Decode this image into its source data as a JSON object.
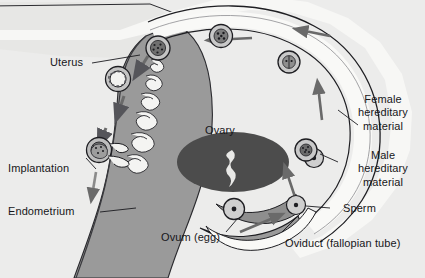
{
  "figure": {
    "background_color": "#ececeb",
    "outline_color": "#1b1b1f",
    "tissue_color": "#9a9a9a",
    "ovary_color": "#4c4c4c",
    "lumen_color": "#f7f7f5",
    "cavity_color": "#e6e6e4",
    "text_color": "#17171a"
  },
  "labels": {
    "uterus": "Uterus",
    "implantation": "Implantation",
    "endometrium": "Endometrium",
    "ovary": "Ovary",
    "ovum": "Ovum (egg)",
    "oviduct": "Oviduct (fallopian tube)",
    "sperm": "Sperm",
    "female_hereditary": {
      "line1": "Female",
      "line2": "hereditary",
      "line3": "material"
    },
    "male_hereditary": {
      "line1": "Male",
      "line2": "hereditary",
      "line3": "material"
    }
  },
  "structures": [
    {
      "name": "uterine-cavity",
      "label": "Uterus"
    },
    {
      "name": "endometrium",
      "label": "Endometrium"
    },
    {
      "name": "ovary",
      "label": "Ovary"
    },
    {
      "name": "oviduct",
      "label": "Oviduct (fallopian tube)"
    },
    {
      "name": "fimbriae",
      "label": ""
    }
  ],
  "cells": [
    {
      "name": "sperm-lower-right",
      "type": "sperm",
      "cx": 296,
      "cy": 205
    },
    {
      "name": "sperm-mid-right",
      "type": "sperm",
      "cx": 312,
      "cy": 160
    },
    {
      "name": "ovum-egg",
      "type": "ovum",
      "cx": 234,
      "cy": 209
    },
    {
      "name": "zygote-fertilized",
      "type": "zygote",
      "cx": 306,
      "cy": 152
    },
    {
      "name": "cleavage-2cell",
      "type": "cleavage",
      "cx": 289,
      "cy": 62
    },
    {
      "name": "morula",
      "type": "morula",
      "cx": 221,
      "cy": 36
    },
    {
      "name": "blastocyst-early",
      "type": "blastocyst",
      "cx": 158,
      "cy": 48
    },
    {
      "name": "blastocyst-late",
      "type": "blastocyst",
      "cx": 118,
      "cy": 79
    },
    {
      "name": "implanting-blastocyst",
      "type": "implanting",
      "cx": 99,
      "cy": 150
    }
  ],
  "arrows": [
    {
      "name": "arrow-fimbria-inward",
      "direction": "up-right"
    },
    {
      "name": "arrow-oviduct-up",
      "direction": "up"
    },
    {
      "name": "arrow-oviduct-top",
      "direction": "left"
    },
    {
      "name": "arrow-oviduct-top-2",
      "direction": "left"
    },
    {
      "name": "arrow-uterus-down-1",
      "direction": "down-left"
    },
    {
      "name": "arrow-uterus-down-2",
      "direction": "down-left"
    },
    {
      "name": "arrow-uterus-down-3",
      "direction": "down"
    },
    {
      "name": "arrow-implantation",
      "direction": "down"
    }
  ]
}
